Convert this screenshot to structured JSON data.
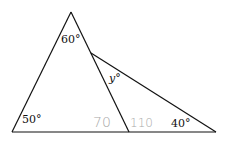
{
  "diagram": {
    "type": "geometry-triangles",
    "labels": {
      "top_angle": "60°",
      "bottom_left_angle": "50°",
      "bottom_right_angle": "40°",
      "unknown_angle": "y°"
    },
    "handwritten": {
      "left_annotation": "70",
      "right_annotation": "110"
    },
    "colors": {
      "lines": "#111111",
      "handwriting": "#a8a8a8"
    }
  }
}
